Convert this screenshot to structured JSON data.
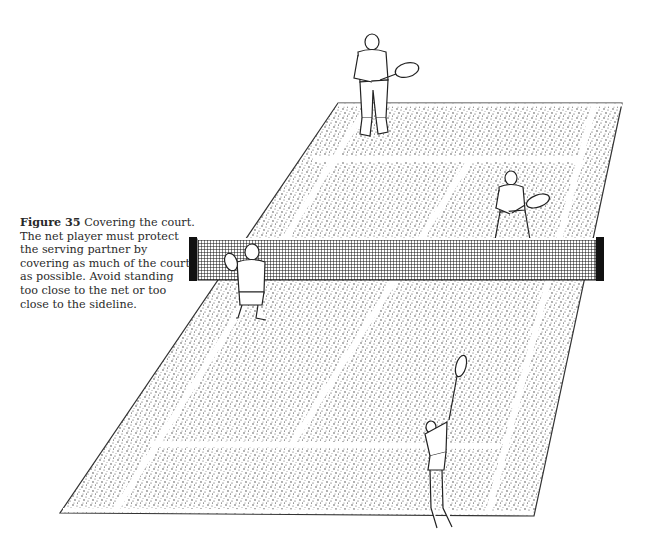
{
  "figure": {
    "label": "Figure 35",
    "caption": "Covering the court. The net player must protect the serving partner by covering as much of the court as possible. Avoid standing too close to the net or too close to the sideline."
  },
  "illustration": {
    "subject": "tennis-doubles-court",
    "players": [
      "far-baseline-player",
      "far-net-player",
      "near-net-player",
      "near-server"
    ],
    "colors": {
      "ink": "#1a1a1a",
      "paper": "#ffffff",
      "lines": "#ffffff"
    }
  }
}
